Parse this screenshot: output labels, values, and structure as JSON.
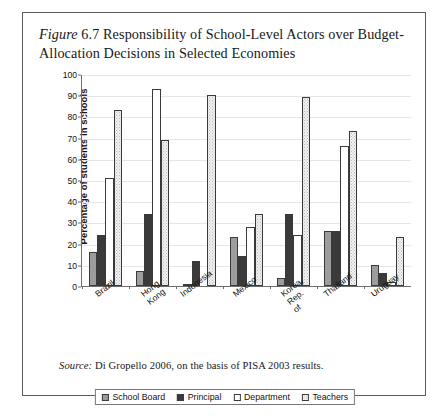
{
  "figure": {
    "label_word": "Figure",
    "number": "6.7",
    "title": "Responsibility of School-Level Actors over Budget-Allocation Decisions in Selected Economies",
    "title_line1": "Responsibility of School-Level Actors over",
    "title_line2": "Budget-Allocation Decisions in Selected Economies",
    "source_word": "Source:",
    "source_text": "Di Gropello 2006, on the basis of PISA 2003 results."
  },
  "chart_data": {
    "type": "bar",
    "title": "Responsibility of School-Level Actors over Budget-Allocation Decisions in Selected Economies",
    "xlabel": "",
    "ylabel": "Percentage of students in schools",
    "ylim": [
      0,
      100
    ],
    "yticks": [
      0,
      10,
      20,
      30,
      40,
      50,
      60,
      70,
      80,
      90,
      100
    ],
    "grid": true,
    "legend_position": "bottom",
    "categories": [
      "Brazil",
      "Hong Kong",
      "Indonesia",
      "Mexico",
      "Korea, Rep. of",
      "Thailand",
      "Uruguay"
    ],
    "category_lines": [
      [
        "Brazil"
      ],
      [
        "Hong Kong"
      ],
      [
        "Indonesia"
      ],
      [
        "Mexico"
      ],
      [
        "Korea,",
        "Rep. of"
      ],
      [
        "Thailand"
      ],
      [
        "Uruguay"
      ]
    ],
    "series": [
      {
        "name": "School Board",
        "color": "#9d9d9d",
        "values": [
          16,
          7,
          1,
          23,
          4,
          26,
          10
        ]
      },
      {
        "name": "Principal",
        "color": "#3a3a3a",
        "values": [
          24,
          34,
          12,
          14,
          34,
          26,
          6
        ]
      },
      {
        "name": "Department",
        "color": "#ffffff",
        "values": [
          51,
          93,
          0,
          28,
          24,
          66,
          2
        ]
      },
      {
        "name": "Teachers",
        "color": "#f2f2f2",
        "values": [
          83,
          69,
          90,
          34,
          89,
          73,
          23
        ]
      }
    ]
  }
}
